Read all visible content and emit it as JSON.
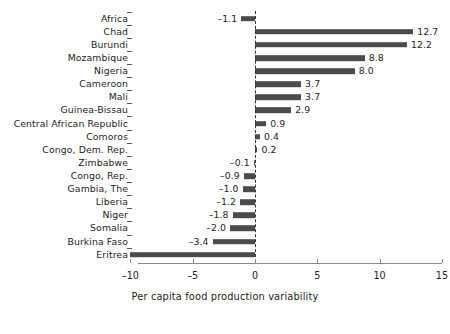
{
  "chart_data": {
    "type": "bar",
    "orientation": "horizontal",
    "title": "",
    "xlabel": "Per capita food production variability",
    "ylabel": "",
    "xlim": [
      -10,
      15
    ],
    "xticks": [
      -10,
      -5,
      0,
      5,
      10,
      15
    ],
    "xticklabels": [
      "–10",
      "–5",
      "0",
      "5",
      "10",
      "15"
    ],
    "grid": false,
    "legend": null,
    "zero_reference_line": true,
    "bar_color": "#4b4b4b",
    "background_color": "#ffffff",
    "categories": [
      "Africa",
      "Chad",
      "Burundi",
      "Mozambique",
      "Nigeria",
      "Cameroon",
      "Mali",
      "Guinea-Bissau",
      "Central African Republic",
      "Comoros",
      "Congo, Dem. Rep.",
      "Zimbabwe",
      "Congo, Rep.",
      "Gambia, The",
      "Liberia",
      "Niger",
      "Somalia",
      "Burkina Faso",
      "Eritrea"
    ],
    "values": [
      -1.1,
      12.7,
      12.2,
      8.8,
      8.0,
      3.7,
      3.7,
      2.9,
      0.9,
      0.4,
      0.2,
      -0.1,
      -0.9,
      -1.0,
      -1.2,
      -1.8,
      -2.0,
      -3.4,
      -10.0
    ],
    "value_labels": [
      "–1.1",
      "12.7",
      "12.2",
      "8.8",
      "8.0",
      "3.7",
      "3.7",
      "2.9",
      "0.9",
      "0.4",
      "0.2",
      "–0.1",
      "–0.9",
      "–1.0",
      "–1.2",
      "–1.8",
      "–2.0",
      "–3.4",
      ""
    ]
  }
}
